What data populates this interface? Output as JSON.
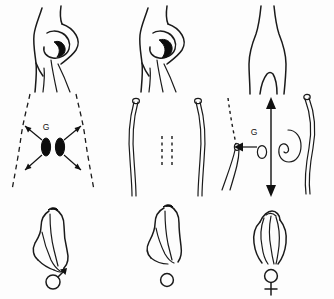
{
  "figure": {
    "background_color": "#fdfdfd",
    "ink_color": "#1a1a1a",
    "columns": [
      {
        "id": "male",
        "label": "Male pathway"
      },
      {
        "id": "indifferent",
        "label": "Indifferent / neuter pathway"
      },
      {
        "id": "female",
        "label": "Female pathway"
      }
    ],
    "rows": [
      {
        "id": "body",
        "label": "Body form / torso"
      },
      {
        "id": "gonad",
        "label": "Gonads and ducts"
      },
      {
        "id": "genitalia",
        "label": "External genitalia"
      }
    ]
  },
  "panels": {
    "top_left": {
      "name": "torso-developed-left",
      "description": "Torso in profile with developed breast and dark nipple shading"
    },
    "top_middle": {
      "name": "torso-developed-middle",
      "description": "Torso in profile with developed breast and dark nipple shading"
    },
    "top_right": {
      "name": "torso-flat-right",
      "description": "Flat undeveloped torso in profile without breast"
    },
    "middle_left": {
      "name": "gonads-radiating",
      "gonad_label": "G",
      "description": "Dashed body outline with two dark gonads and four arrows radiating outward",
      "arrow_count": 4,
      "gonad_count": 2,
      "outline_style": "dashed"
    },
    "middle_middle": {
      "name": "ducts-paired",
      "description": "Two curved ducts with open terminal circles and a central dashed midline",
      "duct_count": 2,
      "midline_style": "dashed",
      "dash_columns": 2
    },
    "middle_right": {
      "name": "gonad-migration",
      "gonad_label": "G",
      "description": "Dashed left duct, solid right duct, vertical double-headed arrow and a leftward arrow beside a small oval and a bean-shaped gonad",
      "vertical_arrow": "double-headed",
      "lateral_arrow": "left"
    },
    "bottom_left": {
      "name": "genitalia-male",
      "symbol": "male",
      "symbol_glyph": "♂",
      "description": "External genitalia outline with male Mars symbol below"
    },
    "bottom_middle": {
      "name": "genitalia-indifferent",
      "symbol": "neuter",
      "symbol_glyph": "○",
      "description": "External genitalia outline with plain circle symbol below"
    },
    "bottom_right": {
      "name": "genitalia-female",
      "symbol": "female",
      "symbol_glyph": "♀",
      "description": "External genitalia outline with female Venus symbol below"
    }
  },
  "labels": {
    "gonad_left": "G",
    "gonad_right": "G"
  },
  "colors": {
    "ink": "#1a1a1a",
    "fill_dark": "#0d0d0d",
    "background": "#fdfdfd",
    "arrow": "#111111"
  }
}
